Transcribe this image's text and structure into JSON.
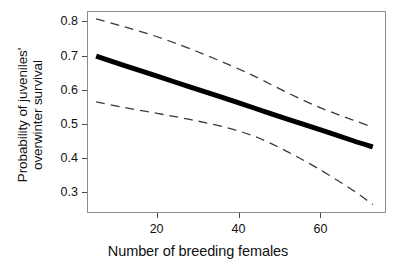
{
  "chart_data": {
    "type": "line",
    "title": "",
    "xlabel": "Number of breeding females",
    "ylabel_line1": "Probability of juveniles'",
    "ylabel_line2": "overwinter survival",
    "xlim": [
      3,
      76
    ],
    "ylim": [
      0.24,
      0.83
    ],
    "xticks": [
      20,
      40,
      60
    ],
    "xtick_labels": [
      "20",
      "40",
      "60"
    ],
    "yticks": [
      0.3,
      0.4,
      0.5,
      0.6,
      0.7,
      0.8
    ],
    "ytick_labels": [
      "0.3",
      "0.4",
      "0.5",
      "0.6",
      "0.7",
      "0.8"
    ],
    "grid": false,
    "legend": "none",
    "series": [
      {
        "name": "fitted-probability",
        "style": "solid",
        "color": "#000000",
        "linewidth": 5,
        "x": [
          5,
          12,
          20,
          28,
          36,
          44,
          52,
          60,
          68,
          73
        ],
        "values": [
          0.7,
          0.672,
          0.641,
          0.609,
          0.578,
          0.546,
          0.514,
          0.483,
          0.451,
          0.432
        ]
      },
      {
        "name": "upper-confidence-limit",
        "style": "dashed",
        "color": "#3a3a3a",
        "linewidth": 1.3,
        "x": [
          5,
          12,
          20,
          28,
          36,
          44,
          52,
          60,
          68,
          73
        ],
        "values": [
          0.81,
          0.786,
          0.757,
          0.722,
          0.683,
          0.64,
          0.592,
          0.548,
          0.512,
          0.49
        ]
      },
      {
        "name": "lower-confidence-limit",
        "style": "dashed",
        "color": "#3a3a3a",
        "linewidth": 1.3,
        "x": [
          5,
          12,
          20,
          28,
          36,
          44,
          52,
          60,
          68,
          73
        ],
        "values": [
          0.565,
          0.548,
          0.531,
          0.513,
          0.492,
          0.463,
          0.418,
          0.365,
          0.305,
          0.262
        ]
      }
    ]
  },
  "axes": {
    "panel_border_color": "#8d8d8d",
    "tick_color": "#4a4a4a",
    "background": "#ffffff"
  }
}
